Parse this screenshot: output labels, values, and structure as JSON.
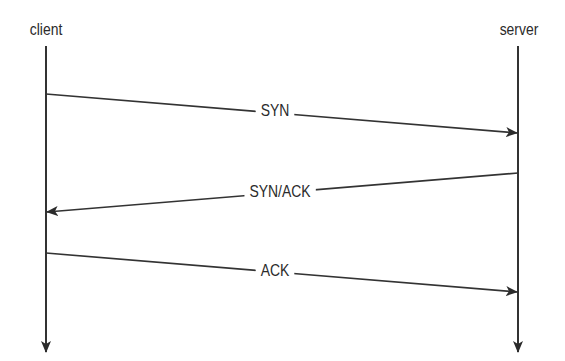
{
  "diagram": {
    "type": "sequence",
    "colors": {
      "line": "#333333",
      "text": "#2b2b2b",
      "background": "#ffffff"
    },
    "participants": [
      {
        "id": "client",
        "label": "client",
        "x": 46,
        "label_y": 30
      },
      {
        "id": "server",
        "label": "server",
        "x": 518,
        "label_y": 30
      }
    ],
    "lifeline": {
      "top": 46,
      "bottom": 352
    },
    "messages": [
      {
        "label": "SYN",
        "from": "client",
        "to": "server",
        "y1": 94,
        "y2": 133,
        "label_x": 275,
        "label_y": 111
      },
      {
        "label": "SYN/ACK",
        "from": "server",
        "to": "client",
        "y1": 173,
        "y2": 212,
        "label_x": 280,
        "label_y": 192
      },
      {
        "label": "ACK",
        "from": "client",
        "to": "server",
        "y1": 253,
        "y2": 292,
        "label_x": 275,
        "label_y": 271
      }
    ]
  }
}
